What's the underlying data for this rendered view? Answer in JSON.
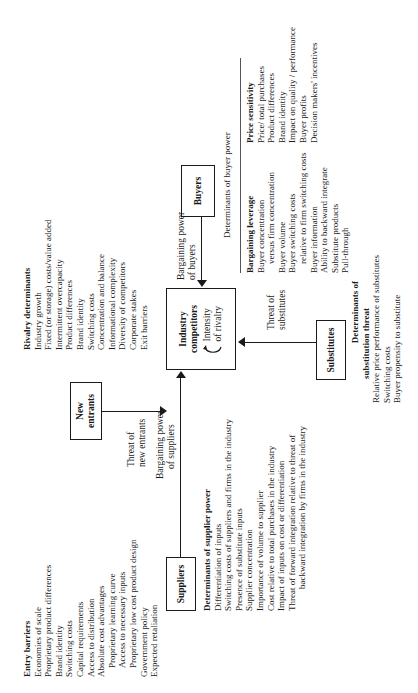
{
  "diagram": {
    "boxes": {
      "new_entrants": "New entrants",
      "industry_competitors": "Industry competitors",
      "intensity_of_rivalry": "Intensity of rivalry",
      "suppliers": "Suppliers",
      "buyers": "Buyers",
      "substitutes": "Substitutes"
    },
    "arrow_labels": {
      "threat_of_new_entrants": [
        "Threat of",
        "new entrants"
      ],
      "bargaining_power_of_suppliers": [
        "Bargaining power",
        "of suppliers"
      ],
      "bargaining_power_of_buyers": [
        "Bargaining power",
        "of buyers"
      ],
      "threat_of_substitutes": [
        "Threat of",
        "substitutes"
      ]
    },
    "entry_barriers": {
      "title": "Entry barriers",
      "items": [
        "Economies of scale",
        "Proprietary product differences",
        "Brand identity",
        "Switching costs",
        "Capital requirements",
        "Access to distribution",
        "Absolute cost advantages"
      ],
      "sub_items": [
        "Proprietary learning curve",
        "Access to necessary inputs",
        "Proprietary low cost product design"
      ],
      "tail_items": [
        "Government policy",
        "Expected retaliation"
      ]
    },
    "rivalry_determinants": {
      "title": "Rivalry determinants",
      "items": [
        "Industry growth",
        "Fixed (or storage) costs/value added",
        "Intermittent overcapacity",
        "Product differences",
        "Brand identity",
        "Switching costs",
        "Concentration and balance",
        "Informational complexity",
        "Diversity of competitors",
        "Corporate stakes",
        "Exit barriers"
      ]
    },
    "supplier_power": {
      "title": "Determinants of supplier power",
      "items": [
        "Differentiation of inputs",
        "Switching costs of suppliers and firms in the industry",
        "Presence of substitute inputs",
        "Supplier concentration",
        "Importance of volume to supplier",
        "Cost relative to total purchases in the industry",
        "Impact of inputs on cost or differentiation",
        "Threat of forward integration relative to threat of"
      ],
      "continuation": "backward integration by firms in the industry"
    },
    "substitution_threat": {
      "title_lines": [
        "Determinants of",
        "substitution threat"
      ],
      "items": [
        "Relative price performance of substitutes",
        "Switching costs",
        "Buyer propensity to substitute"
      ]
    },
    "buyer_power": {
      "title": "Determinants of buyer power",
      "bargaining_leverage": {
        "title": "Bargaining leverage",
        "items": [
          {
            "text": "Buyer concentration",
            "indent": false
          },
          {
            "text": "versus firm concentration",
            "indent": true
          },
          {
            "text": "Buyer volume",
            "indent": false
          },
          {
            "text": "Buyer switching costs",
            "indent": false
          },
          {
            "text": "relative to firm switching costs",
            "indent": true
          },
          {
            "text": "Buyer information",
            "indent": false
          },
          {
            "text": "Ability to backward integrate",
            "indent": false
          },
          {
            "text": "Substitute products",
            "indent": false
          },
          {
            "text": "Pull-through",
            "indent": false
          }
        ]
      },
      "price_sensitivity": {
        "title": "Price sensitivity",
        "items": [
          "Price/ total purchases",
          "Product differences",
          "Brand identity",
          "Impact on quality / performance",
          "Buyer profits",
          "Decision makers' incentives"
        ]
      }
    }
  }
}
